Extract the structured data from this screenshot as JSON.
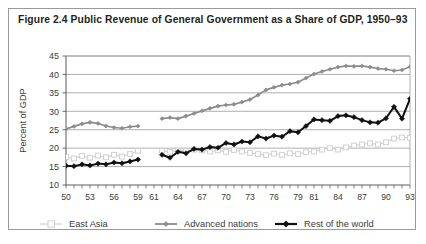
{
  "figure": {
    "title": "Figure 2.4 Public Revenue of General Government as a Share of GDP, 1950–93",
    "border_color": "#9a9a9a",
    "background": "#ffffff"
  },
  "chart_data": {
    "type": "line",
    "title": "Figure 2.4 Public Revenue of General Government as a Share of GDP, 1950–93",
    "xlabel": "",
    "ylabel": "Percent of GDP",
    "ylim": [
      10,
      45
    ],
    "yticks": [
      10,
      15,
      20,
      25,
      30,
      35,
      40,
      45
    ],
    "ytick_labels": [
      "10",
      "15",
      "20",
      "25",
      "30",
      "35",
      "40",
      "45"
    ],
    "xlim": [
      1950,
      1993
    ],
    "xtick_labels": [
      "50",
      "53",
      "56",
      "59",
      "61",
      "64",
      "67",
      "70",
      "73",
      "76",
      "79",
      "81",
      "84",
      "87",
      "90",
      "93"
    ],
    "xtick_years": [
      1950,
      1953,
      1956,
      1959,
      1961,
      1964,
      1967,
      1970,
      1973,
      1976,
      1979,
      1981,
      1984,
      1987,
      1990,
      1993
    ],
    "grid": "horizontal",
    "legend_position": "bottom",
    "x": [
      1950,
      1951,
      1952,
      1953,
      1954,
      1955,
      1956,
      1957,
      1958,
      1959,
      1960,
      1961,
      1962,
      1963,
      1964,
      1965,
      1966,
      1967,
      1968,
      1969,
      1970,
      1971,
      1972,
      1973,
      1974,
      1975,
      1976,
      1977,
      1978,
      1979,
      1980,
      1981,
      1982,
      1983,
      1984,
      1985,
      1986,
      1987,
      1988,
      1989,
      1990,
      1991,
      1992,
      1993
    ],
    "series": [
      {
        "name": "East Asia",
        "color": "#d0d0d0",
        "marker": "open-square",
        "values": [
          17.6,
          17.2,
          17.9,
          17.4,
          18.0,
          17.5,
          18.2,
          17.7,
          18.4,
          19.3,
          null,
          null,
          19.3,
          19.0,
          19.4,
          19.2,
          19.6,
          19.4,
          19.1,
          19.4,
          19.0,
          19.5,
          19.1,
          18.7,
          18.4,
          18.1,
          18.5,
          18.2,
          18.6,
          18.4,
          18.9,
          19.1,
          19.6,
          20.0,
          19.6,
          20.2,
          20.7,
          21.0,
          21.3,
          21.0,
          21.6,
          22.6,
          22.9,
          22.8
        ]
      },
      {
        "name": "Advanced nations",
        "color": "#8c8c8c",
        "marker": "filled-diamond",
        "values": [
          25.2,
          25.9,
          26.6,
          27.0,
          26.7,
          26.0,
          25.6,
          25.4,
          25.8,
          26.0,
          null,
          null,
          28.0,
          28.3,
          28.0,
          28.7,
          29.4,
          30.1,
          30.8,
          31.4,
          31.7,
          31.9,
          32.5,
          33.2,
          34.4,
          35.8,
          36.5,
          37.1,
          37.4,
          37.9,
          39.0,
          40.1,
          40.8,
          41.4,
          42.0,
          42.3,
          42.2,
          42.3,
          42.0,
          41.6,
          41.4,
          41.0,
          41.2,
          42.1
        ]
      },
      {
        "name": "Rest of the world",
        "color": "#111111",
        "marker": "filled-diamond",
        "values": [
          15.2,
          15.1,
          15.6,
          15.3,
          15.8,
          15.6,
          16.1,
          15.9,
          16.4,
          16.9,
          null,
          null,
          18.2,
          17.4,
          19.0,
          18.6,
          19.8,
          19.6,
          20.3,
          20.1,
          21.4,
          21.0,
          21.8,
          21.6,
          23.2,
          22.6,
          23.4,
          23.1,
          24.6,
          24.3,
          26.0,
          27.8,
          27.6,
          27.4,
          28.7,
          28.9,
          28.4,
          27.6,
          27.0,
          26.9,
          28.1,
          31.2,
          28.0,
          33.4
        ]
      }
    ]
  },
  "legend": {
    "items": [
      {
        "label": "East Asia",
        "color": "#d0d0d0",
        "marker": "open-square"
      },
      {
        "label": "Advanced nations",
        "color": "#8c8c8c",
        "marker": "filled-diamond"
      },
      {
        "label": "Rest of the world",
        "color": "#111111",
        "marker": "filled-diamond"
      }
    ]
  }
}
